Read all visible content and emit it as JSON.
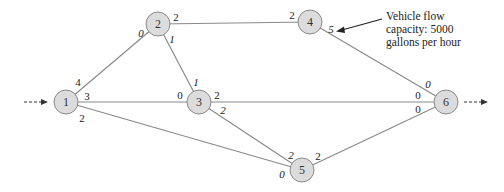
{
  "diagram": {
    "nodes": [
      {
        "id": "1",
        "label": "1",
        "x": 66,
        "y": 102
      },
      {
        "id": "2",
        "label": "2",
        "x": 158,
        "y": 24
      },
      {
        "id": "3",
        "label": "3",
        "x": 199,
        "y": 102
      },
      {
        "id": "4",
        "label": "4",
        "x": 310,
        "y": 22
      },
      {
        "id": "5",
        "label": "5",
        "x": 302,
        "y": 170
      },
      {
        "id": "6",
        "label": "6",
        "x": 446,
        "y": 102
      }
    ],
    "edges": [
      {
        "from": "1",
        "to": "2",
        "cap_from": "4",
        "cap_to": "0"
      },
      {
        "from": "1",
        "to": "3",
        "cap_from": "3",
        "cap_to": "0"
      },
      {
        "from": "1",
        "to": "5",
        "cap_from": "2",
        "cap_to": "0"
      },
      {
        "from": "2",
        "to": "4",
        "cap_from": "2",
        "cap_to": "2"
      },
      {
        "from": "2",
        "to": "3",
        "cap_from": "1",
        "cap_to": "1"
      },
      {
        "from": "3",
        "to": "6",
        "cap_from": "2",
        "cap_to": "0"
      },
      {
        "from": "3",
        "to": "5",
        "cap_from": "2",
        "cap_to": "2"
      },
      {
        "from": "4",
        "to": "6",
        "cap_from": "5",
        "cap_to": "0"
      },
      {
        "from": "5",
        "to": "6",
        "cap_from": "2",
        "cap_to": "0"
      }
    ],
    "capacity_labels": {
      "e12_a": "4",
      "e12_b": "0",
      "e13_a": "3",
      "e13_b": "0",
      "e15_a": "2",
      "e15_b": "0",
      "e24_a": "2",
      "e24_b": "2",
      "e23_a": "1",
      "e23_b": "1",
      "e36_a": "2",
      "e36_b": "0",
      "e35_a": "2",
      "e35_b": "2",
      "e46_a": "5",
      "e46_b": "0",
      "e56_a": "2",
      "e56_b": "0"
    },
    "annotation": {
      "line1": "Vehicle flow",
      "line2": "capacity: 5000",
      "line3": "gallons per hour"
    },
    "source_arrow": "inflow",
    "sink_arrow": "outflow"
  }
}
